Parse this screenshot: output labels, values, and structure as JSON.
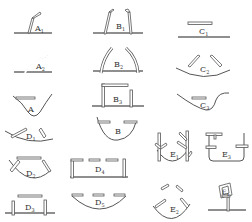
{
  "figure": {
    "type": "grid of hydraulic/structure sketches",
    "panels": [
      {
        "id": "A1",
        "letter": "A",
        "sub": "1",
        "desc": "inclined bent pipe on flat ground"
      },
      {
        "id": "A2",
        "letter": "A",
        "sub": "2",
        "desc": "curved pipe on flat ground"
      },
      {
        "id": "A",
        "letter": "A",
        "sub": "",
        "desc": "bar over V-shaped valley"
      },
      {
        "id": "B1",
        "letter": "B",
        "sub": "1",
        "desc": "two inclined pipes on flat ground"
      },
      {
        "id": "B2",
        "letter": "B",
        "sub": "2",
        "desc": "two curved pipes on flat ground"
      },
      {
        "id": "B3",
        "letter": "B",
        "sub": "3",
        "desc": "inverted L-frame and post on ground"
      },
      {
        "id": "B",
        "letter": "B",
        "sub": "",
        "desc": "two bars over U-shaped basin"
      },
      {
        "id": "C1",
        "letter": "C",
        "sub": "1",
        "desc": "horizontal bar above flat line"
      },
      {
        "id": "C2",
        "letter": "C",
        "sub": "2",
        "desc": "two inclined bars over concave arc"
      },
      {
        "id": "C3",
        "letter": "C",
        "sub": "3",
        "desc": "bar over asymmetric valley"
      },
      {
        "id": "D1",
        "letter": "D",
        "sub": "1",
        "desc": "two bars over shallow basin"
      },
      {
        "id": "D2",
        "letter": "D",
        "sub": "2",
        "desc": "bar and two pegs over basin"
      },
      {
        "id": "D3",
        "letter": "D",
        "sub": "3",
        "desc": "bar between two posts on ground"
      },
      {
        "id": "D4",
        "letter": "D",
        "sub": "4",
        "desc": "dashed beam on posts"
      },
      {
        "id": "D5",
        "letter": "D",
        "sub": "5",
        "desc": "dashed bars over arc"
      },
      {
        "id": "E1",
        "letter": "E",
        "sub": "1",
        "desc": "branched posts over basin"
      },
      {
        "id": "E2",
        "letter": "E",
        "sub": "2",
        "desc": "scattered bars over basin"
      },
      {
        "id": "E3",
        "letter": "E",
        "sub": "3",
        "desc": "tank with T-fitting and side bars"
      },
      {
        "id": "E4",
        "letter": "E",
        "sub": "4",
        "desc": "framed sign on post"
      }
    ]
  },
  "labels": {
    "A1": {
      "letter": "A",
      "sub": "1"
    },
    "A2": {
      "letter": "A",
      "sub": "2"
    },
    "A": {
      "letter": "A",
      "sub": ""
    },
    "B1": {
      "letter": "B",
      "sub": "1"
    },
    "B2": {
      "letter": "B",
      "sub": "2"
    },
    "B3": {
      "letter": "B",
      "sub": "3"
    },
    "B": {
      "letter": "B",
      "sub": ""
    },
    "C1": {
      "letter": "C",
      "sub": "1"
    },
    "C2": {
      "letter": "C",
      "sub": "2"
    },
    "C3": {
      "letter": "C",
      "sub": "3"
    },
    "D1": {
      "letter": "D",
      "sub": "1"
    },
    "D2": {
      "letter": "D",
      "sub": "2"
    },
    "D3": {
      "letter": "D",
      "sub": "3"
    },
    "D4": {
      "letter": "D",
      "sub": "4"
    },
    "D5": {
      "letter": "D",
      "sub": "5"
    },
    "E1": {
      "letter": "E",
      "sub": "1"
    },
    "E2": {
      "letter": "E",
      "sub": "2"
    },
    "E3": {
      "letter": "E",
      "sub": "3"
    },
    "E4": {
      "letter": "E",
      "sub": "4"
    }
  },
  "colors": {
    "line": "#555555",
    "ground": "#6a6a6a",
    "background": "#ffffff"
  }
}
